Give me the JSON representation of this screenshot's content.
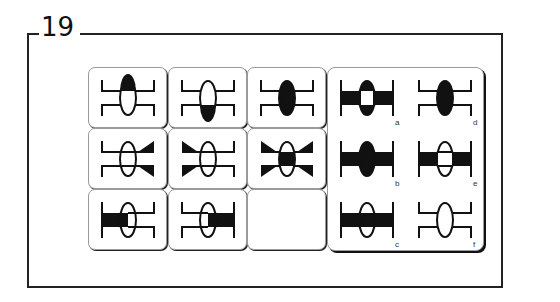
{
  "question": {
    "number": "19"
  },
  "matrix": [
    {
      "row": 0,
      "col": 0,
      "figure": "fig_top_half_filled"
    },
    {
      "row": 0,
      "col": 1,
      "figure": "fig_bottom_half_filled"
    },
    {
      "row": 0,
      "col": 2,
      "figure": "fig_full_filled"
    },
    {
      "row": 1,
      "col": 0,
      "figure": "fig_right_bowtie"
    },
    {
      "row": 1,
      "col": 1,
      "figure": "fig_left_bowtie"
    },
    {
      "row": 1,
      "col": 2,
      "figure": "fig_both_bowtie_center_filled"
    },
    {
      "row": 2,
      "col": 0,
      "figure": "fig_left_bar"
    },
    {
      "row": 2,
      "col": 1,
      "figure": "fig_right_bar"
    },
    {
      "row": 2,
      "col": 2,
      "figure": "empty"
    }
  ],
  "options": [
    {
      "label": "a",
      "figure": "fig_bar_oval_hollow_center"
    },
    {
      "label": "b",
      "figure": "fig_bar_full_oval"
    },
    {
      "label": "c",
      "figure": "fig_bar_outline_oval"
    },
    {
      "label": "d",
      "figure": "fig_full_filled"
    },
    {
      "label": "e",
      "figure": "fig_bar_oval_white"
    },
    {
      "label": "f",
      "figure": "fig_plain"
    }
  ],
  "colors": {
    "ink": "#111111",
    "border": "#9a9a9a",
    "background": "#ffffff"
  }
}
